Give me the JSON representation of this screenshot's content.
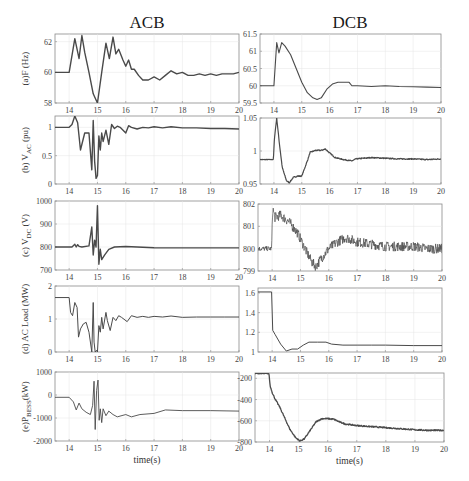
{
  "columns": [
    {
      "title": "ACB"
    },
    {
      "title": "DCB"
    }
  ],
  "chart_data": [
    {
      "id": "a-acb",
      "type": "line",
      "column": "ACB",
      "ylabel": "(a)F (Hz)",
      "xlabel": "",
      "xlim": [
        13.5,
        20
      ],
      "ylim": [
        58,
        62.5
      ],
      "xticks": [
        14,
        15,
        16,
        17,
        18,
        19,
        20
      ],
      "yticks": [
        58,
        60,
        62
      ],
      "ytick_labels": [
        "58",
        "60",
        "62"
      ],
      "grid": true,
      "noisy": false,
      "stroke_width": 1.4,
      "x": [
        13.5,
        14.0,
        14.2,
        14.35,
        14.45,
        14.55,
        14.7,
        14.85,
        15.0,
        15.15,
        15.3,
        15.42,
        15.55,
        15.65,
        15.75,
        15.9,
        16.0,
        16.1,
        16.2,
        16.3,
        16.45,
        16.6,
        16.8,
        17.0,
        17.2,
        17.4,
        17.6,
        17.8,
        18.0,
        18.2,
        18.4,
        18.6,
        18.8,
        19.0,
        19.2,
        19.4,
        19.6,
        19.8,
        20.0
      ],
      "y": [
        60,
        60,
        62.2,
        60.9,
        62.4,
        61.3,
        60.0,
        58.6,
        58.0,
        60.0,
        61.9,
        60.9,
        62.3,
        61.2,
        61.5,
        60.8,
        60.4,
        60.8,
        60.2,
        60.2,
        59.8,
        59.5,
        59.5,
        59.7,
        59.5,
        59.8,
        60.1,
        59.9,
        60.0,
        59.8,
        59.8,
        59.9,
        59.8,
        59.9,
        59.8,
        59.9,
        59.9,
        59.9,
        60.0
      ]
    },
    {
      "id": "a-dcb",
      "type": "line",
      "column": "DCB",
      "ylabel": "",
      "xlabel": "",
      "xlim": [
        13.5,
        20
      ],
      "ylim": [
        59.5,
        61.5
      ],
      "xticks": [
        14,
        15,
        16,
        17,
        18,
        19,
        20
      ],
      "yticks": [
        59.5,
        60,
        60.5,
        61,
        61.5
      ],
      "ytick_labels": [
        "59.5",
        "60",
        "60.5",
        "61",
        "61.5"
      ],
      "grid": true,
      "noisy": false,
      "stroke_width": 1.1,
      "x": [
        13.5,
        14.0,
        14.1,
        14.18,
        14.28,
        14.4,
        14.6,
        14.8,
        15.0,
        15.2,
        15.4,
        15.55,
        15.7,
        15.9,
        16.1,
        16.3,
        16.5,
        16.7,
        16.8,
        17.0,
        17.5,
        18.0,
        18.5,
        19.0,
        19.5,
        20.0
      ],
      "y": [
        60,
        60,
        61.25,
        60.95,
        61.25,
        61.15,
        60.9,
        60.5,
        60.1,
        59.8,
        59.65,
        59.6,
        59.65,
        59.9,
        60.05,
        60.1,
        60.1,
        60.1,
        60.0,
        60.0,
        59.98,
        60.0,
        59.98,
        59.97,
        59.96,
        59.95
      ]
    },
    {
      "id": "b-acb",
      "type": "line",
      "column": "ACB",
      "ylabel": "(b) V_AC (pu)",
      "xlabel": "",
      "xlim": [
        13.5,
        20
      ],
      "ylim": [
        0,
        1.2
      ],
      "xticks": [
        14,
        15,
        16,
        17,
        18,
        19,
        20
      ],
      "yticks": [
        0,
        0.5,
        1
      ],
      "ytick_labels": [
        "0",
        "0.5",
        "1"
      ],
      "grid": true,
      "noisy": false,
      "stroke_width": 1.4,
      "x": [
        13.5,
        14.0,
        14.1,
        14.2,
        14.3,
        14.4,
        14.55,
        14.7,
        14.8,
        14.85,
        14.9,
        14.95,
        15.0,
        15.05,
        15.1,
        15.15,
        15.2,
        15.3,
        15.4,
        15.5,
        15.6,
        15.7,
        15.8,
        16.0,
        16.1,
        16.2,
        16.4,
        16.6,
        16.8,
        17.0,
        17.3,
        17.6,
        18.0,
        18.5,
        19.0,
        19.5,
        20.0
      ],
      "y": [
        1.0,
        1.0,
        1.05,
        1.2,
        1.08,
        0.6,
        0.9,
        0.9,
        0.25,
        1.12,
        0.4,
        0.1,
        0.15,
        0.85,
        0.6,
        0.9,
        0.75,
        0.95,
        0.7,
        1.05,
        0.98,
        1.02,
        1.0,
        0.9,
        1.03,
        1.0,
        0.97,
        1.0,
        0.99,
        1.01,
        0.99,
        1.01,
        0.99,
        0.99,
        0.98,
        0.98,
        0.97
      ]
    },
    {
      "id": "b-dcb",
      "type": "line",
      "column": "DCB",
      "ylabel": "",
      "xlabel": "",
      "xlim": [
        13.5,
        20
      ],
      "ylim": [
        0.95,
        1.05
      ],
      "xticks": [
        14,
        15,
        16,
        17,
        18,
        19,
        20
      ],
      "yticks": [
        0.95,
        1,
        1.05
      ],
      "ytick_labels": [
        "0.95",
        "1",
        "1.05"
      ],
      "grid": true,
      "noisy": true,
      "noise_amp": 0.0008,
      "stroke_width": 1.2,
      "x": [
        13.5,
        13.98,
        14.02,
        14.1,
        14.2,
        14.3,
        14.45,
        14.55,
        14.7,
        14.85,
        15.0,
        15.2,
        15.3,
        15.5,
        15.7,
        15.85,
        16.0,
        16.2,
        16.5,
        16.8,
        16.95,
        17.2,
        17.5,
        18.0,
        18.5,
        19.0,
        19.5,
        20.0
      ],
      "y": [
        0.987,
        0.987,
        1.02,
        1.05,
        1.01,
        0.975,
        0.955,
        0.952,
        0.96,
        0.962,
        0.962,
        0.985,
        0.998,
        1.001,
        1.001,
        1.003,
        0.997,
        0.99,
        0.987,
        0.985,
        0.988,
        0.989,
        0.99,
        0.989,
        0.988,
        0.988,
        0.987,
        0.988
      ]
    },
    {
      "id": "c-acb",
      "type": "line",
      "column": "ACB",
      "ylabel": "(c) V_DC (V)",
      "xlabel": "",
      "xlim": [
        13.5,
        20
      ],
      "ylim": [
        700,
        1000
      ],
      "xticks": [
        14,
        15,
        16,
        17,
        18,
        19,
        20
      ],
      "yticks": [
        700,
        800,
        900,
        1000
      ],
      "ytick_labels": [
        "700",
        "800",
        "900",
        "1000"
      ],
      "grid": true,
      "noisy": false,
      "stroke_width": 1.4,
      "x": [
        13.5,
        14.1,
        14.2,
        14.25,
        14.3,
        14.35,
        14.45,
        14.7,
        14.8,
        14.85,
        14.9,
        14.95,
        15.0,
        15.05,
        15.1,
        15.15,
        15.25,
        15.4,
        15.6,
        16.0,
        17.0,
        18.0,
        19.0,
        20.0
      ],
      "y": [
        800,
        800,
        812,
        800,
        810,
        803,
        800,
        805,
        887,
        765,
        830,
        800,
        980,
        725,
        790,
        745,
        765,
        790,
        800,
        802,
        797,
        796,
        796,
        796
      ]
    },
    {
      "id": "c-dcb",
      "type": "line",
      "column": "DCB",
      "ylabel": "",
      "xlabel": "",
      "xlim": [
        13.5,
        20
      ],
      "ylim": [
        799,
        802
      ],
      "xticks": [
        14,
        15,
        16,
        17,
        18,
        19,
        20
      ],
      "yticks": [
        799,
        800,
        801,
        802
      ],
      "ytick_labels": [
        "799",
        "800",
        "801",
        "802"
      ],
      "grid": true,
      "noisy": true,
      "noise_amp": 0.22,
      "stroke_width": 0.7,
      "x": [
        13.5,
        13.98,
        14.02,
        14.1,
        14.3,
        14.6,
        14.9,
        15.2,
        15.4,
        15.55,
        15.7,
        16.0,
        16.3,
        16.6,
        17.0,
        17.5,
        18.0,
        18.5,
        19.0,
        19.5,
        20.0
      ],
      "y": [
        800,
        800,
        801.8,
        801.4,
        801.5,
        801.2,
        800.7,
        799.9,
        799.4,
        799.2,
        799.5,
        800,
        800.3,
        800.5,
        800.3,
        800.2,
        800.1,
        800.1,
        800.1,
        800.0,
        800.0
      ]
    },
    {
      "id": "d-acb",
      "type": "line",
      "column": "ACB",
      "ylabel": "(d) AC Load (MW)",
      "xlabel": "",
      "xlim": [
        13.5,
        20
      ],
      "ylim": [
        0,
        2
      ],
      "xticks": [
        14,
        15,
        16,
        17,
        18,
        19,
        20
      ],
      "yticks": [
        0,
        1,
        2
      ],
      "ytick_labels": [
        "0",
        "1",
        "2"
      ],
      "grid": true,
      "noisy": false,
      "stroke_width": 1.0,
      "x": [
        13.5,
        14.0,
        14.05,
        14.12,
        14.2,
        14.28,
        14.33,
        14.4,
        14.5,
        14.6,
        14.7,
        14.8,
        14.85,
        14.88,
        14.92,
        14.97,
        15.0,
        15.05,
        15.1,
        15.15,
        15.2,
        15.3,
        15.35,
        15.45,
        15.55,
        15.65,
        15.75,
        15.85,
        16.05,
        16.2,
        16.4,
        16.6,
        16.8,
        17.0,
        17.3,
        17.6,
        18.0,
        18.5,
        19.0,
        19.5,
        20.0
      ],
      "y": [
        1.65,
        1.65,
        1.2,
        1.1,
        1.5,
        1.35,
        0.45,
        0.7,
        0.85,
        0.9,
        0.6,
        0.0,
        1.5,
        0.3,
        0.0,
        0.05,
        0.0,
        0.8,
        0.6,
        1.05,
        0.7,
        1.2,
        0.95,
        0.65,
        1.05,
        0.95,
        1.1,
        1.05,
        0.92,
        1.1,
        1.05,
        1.08,
        1.05,
        1.08,
        1.06,
        1.09,
        1.05,
        1.06,
        1.06,
        1.06,
        1.06
      ]
    },
    {
      "id": "d-dcb",
      "type": "line",
      "column": "DCB",
      "ylabel": "",
      "xlabel": "",
      "xlim": [
        13.5,
        20
      ],
      "ylim": [
        1,
        1.65
      ],
      "xticks": [
        14,
        15,
        16,
        17,
        18,
        19,
        20
      ],
      "yticks": [
        1,
        1.2,
        1.4,
        1.6
      ],
      "ytick_labels": [
        "1",
        "1.2",
        "1.4",
        "1.6"
      ],
      "grid": true,
      "noisy": false,
      "stroke_width": 1.0,
      "x": [
        13.5,
        13.98,
        14.02,
        14.1,
        14.3,
        14.5,
        14.7,
        14.9,
        15.1,
        15.3,
        15.6,
        15.9,
        16.1,
        16.5,
        17.0,
        17.5,
        18.0,
        19.0,
        20.0
      ],
      "y": [
        1.61,
        1.61,
        1.22,
        1.18,
        1.08,
        1.01,
        1.03,
        1.03,
        1.07,
        1.1,
        1.1,
        1.1,
        1.08,
        1.07,
        1.07,
        1.07,
        1.07,
        1.065,
        1.065
      ]
    },
    {
      "id": "e-acb",
      "type": "line",
      "column": "ACB",
      "ylabel": "(e)P_BESS(kW)",
      "xlabel": "time(s)",
      "xlim": [
        13.5,
        20
      ],
      "ylim": [
        -2000,
        1000
      ],
      "xticks": [
        14,
        15,
        16,
        17,
        18,
        19,
        20
      ],
      "yticks": [
        -2000,
        -1000,
        0,
        1000
      ],
      "ytick_labels": [
        "-2000",
        "-1000",
        "0",
        "1000"
      ],
      "grid": true,
      "noisy": false,
      "stroke_width": 0.9,
      "x": [
        13.5,
        14.0,
        14.15,
        14.25,
        14.35,
        14.45,
        14.6,
        14.75,
        14.83,
        14.88,
        14.92,
        14.97,
        15.02,
        15.06,
        15.1,
        15.15,
        15.2,
        15.3,
        15.4,
        15.55,
        15.7,
        16.0,
        16.2,
        16.5,
        17.0,
        17.4,
        18.0,
        19.0,
        20.0
      ],
      "y": [
        -100,
        -100,
        -300,
        -650,
        -350,
        -600,
        -750,
        -850,
        -450,
        600,
        -1500,
        200,
        650,
        -1100,
        -600,
        -1200,
        -600,
        -900,
        -700,
        -850,
        -950,
        -850,
        -950,
        -850,
        -800,
        -650,
        -680,
        -680,
        -700
      ]
    },
    {
      "id": "e-dcb",
      "type": "line",
      "column": "DCB",
      "ylabel": "",
      "xlabel": "time(s)",
      "xlim": [
        13.5,
        20
      ],
      "ylim": [
        -800,
        -150
      ],
      "xticks": [
        14,
        15,
        16,
        17,
        18,
        19,
        20
      ],
      "yticks": [
        -800,
        -600,
        -400,
        -200
      ],
      "ytick_labels": [
        "-800",
        "-600",
        "-400",
        "-200"
      ],
      "grid": true,
      "noisy": true,
      "noise_amp": 6,
      "stroke_width": 1.3,
      "x": [
        13.5,
        13.98,
        14.02,
        14.1,
        14.2,
        14.35,
        14.5,
        14.7,
        14.9,
        15.05,
        15.2,
        15.4,
        15.6,
        15.8,
        16.0,
        16.2,
        16.4,
        16.6,
        17.0,
        17.5,
        18.0,
        18.5,
        19.0,
        19.5,
        20.0
      ],
      "y": [
        -155,
        -155,
        -270,
        -340,
        -400,
        -470,
        -560,
        -680,
        -760,
        -790,
        -770,
        -690,
        -610,
        -580,
        -580,
        -585,
        -610,
        -630,
        -645,
        -655,
        -665,
        -675,
        -685,
        -690,
        -690
      ]
    }
  ],
  "layout": {
    "panels": [
      {
        "chart": 0,
        "x": 55,
        "y": 34,
        "w": 184,
        "h": 69
      },
      {
        "chart": 1,
        "x": 260,
        "y": 34,
        "w": 181,
        "h": 69
      },
      {
        "chart": 2,
        "x": 55,
        "y": 116,
        "w": 184,
        "h": 68
      },
      {
        "chart": 3,
        "x": 260,
        "y": 118,
        "w": 181,
        "h": 66
      },
      {
        "chart": 4,
        "x": 55,
        "y": 201,
        "w": 184,
        "h": 69
      },
      {
        "chart": 5,
        "x": 258,
        "y": 204,
        "w": 184,
        "h": 67
      },
      {
        "chart": 6,
        "x": 55,
        "y": 286,
        "w": 184,
        "h": 66
      },
      {
        "chart": 7,
        "x": 258,
        "y": 288,
        "w": 184,
        "h": 64
      },
      {
        "chart": 8,
        "x": 55,
        "y": 372,
        "w": 184,
        "h": 69
      },
      {
        "chart": 9,
        "x": 255,
        "y": 373,
        "w": 189,
        "h": 69
      }
    ],
    "col_titles": [
      {
        "x": 147,
        "y": 28
      },
      {
        "x": 350,
        "y": 28
      }
    ]
  }
}
